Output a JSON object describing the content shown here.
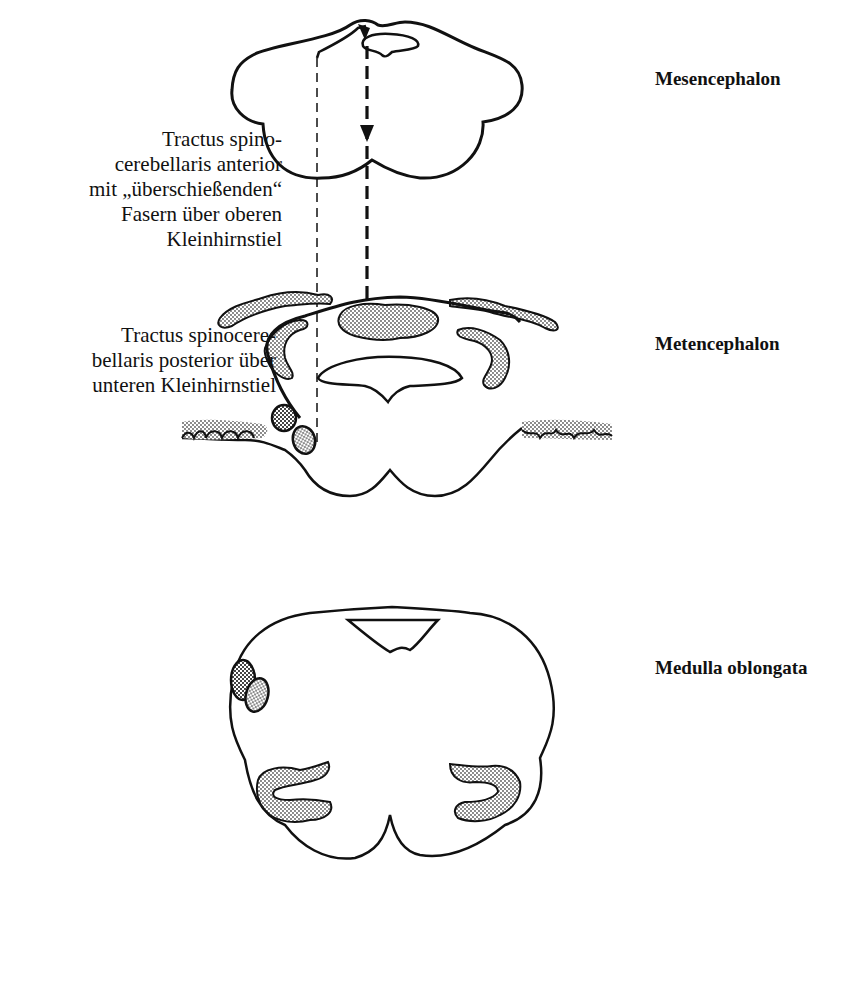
{
  "figure": {
    "regions": [
      {
        "id": "mesencephalon",
        "label": "Mesencephalon"
      },
      {
        "id": "metencephalon",
        "label": "Metencephalon"
      },
      {
        "id": "medulla",
        "label": "Medulla oblongata"
      }
    ],
    "annotations": [
      {
        "id": "anterior",
        "text": "Tractus spino-\ncerebellaris anterior\nmit „überschießenden“\nFasern über oberen\nKleinhirnstiel"
      },
      {
        "id": "posterior",
        "text": "Tractus spinocere-\nbellaris posterior über\nunteren Kleinhirnstiel"
      }
    ],
    "colors": {
      "line": "#111111",
      "stipple": "#9a9a9a",
      "background": "#ffffff"
    }
  }
}
